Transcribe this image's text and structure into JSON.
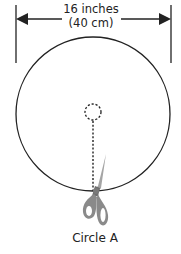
{
  "diagram": {
    "dimension": {
      "line1": "16 inches",
      "line2": "(40 cm)"
    },
    "caption": "Circle A",
    "icons": {
      "cutting_tool": "scissors-icon",
      "center_marker": "dashed-circle-icon"
    },
    "colors": {
      "line": "#222222",
      "scissors": "#8a8a8a",
      "background": "#ffffff"
    }
  }
}
